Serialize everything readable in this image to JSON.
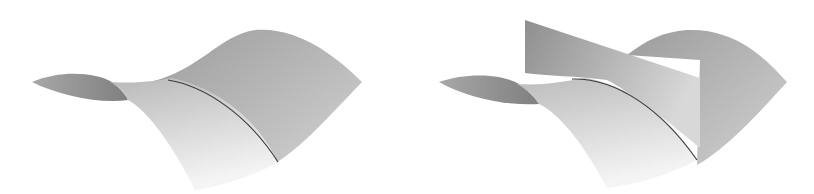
{
  "figure": {
    "panels": [
      {
        "id": "left",
        "description": "saddle surface with curve",
        "has_plane": false
      },
      {
        "id": "right",
        "description": "saddle surface intersected by vertical plane",
        "has_plane": true
      }
    ],
    "colors": {
      "background": "#ffffff",
      "surface_light": "#eeeeee",
      "surface_mid": "#bdbdbd",
      "surface_dark": "#8e8e8e",
      "curve": "#3a3a3a",
      "plane_dark": "#9a9a9a",
      "plane_light": "#d6d6d6"
    }
  }
}
